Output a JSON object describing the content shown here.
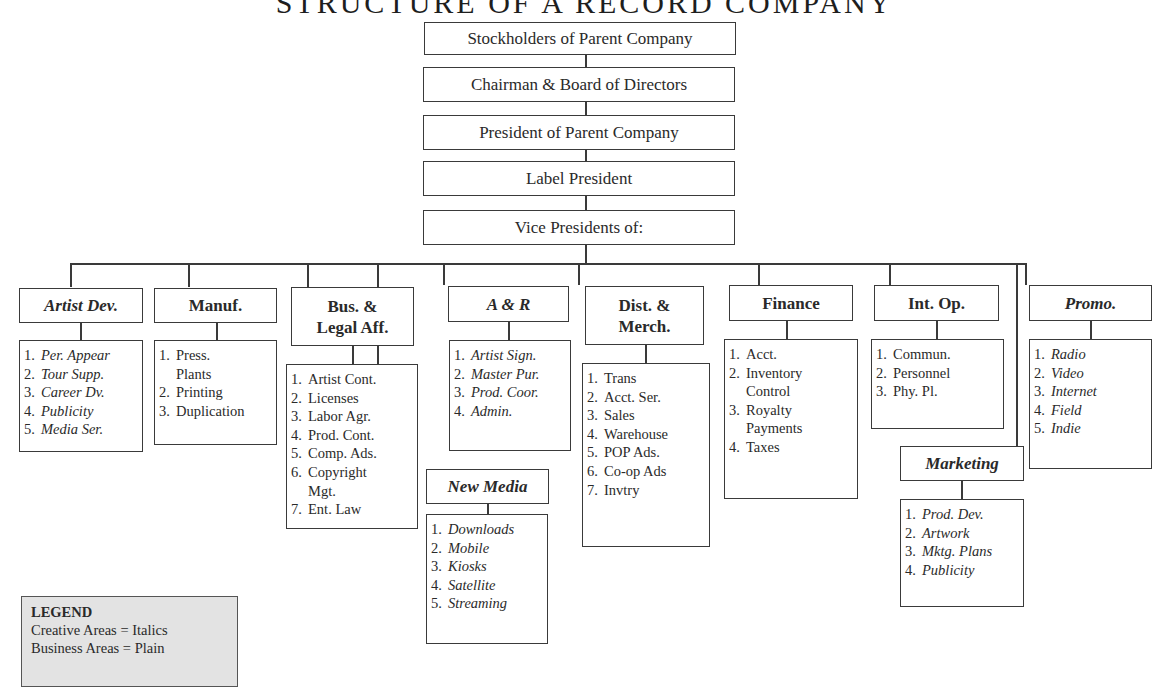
{
  "title": "STRUCTURE OF A RECORD COMPANY",
  "hierarchy": [
    "Stockholders of Parent Company",
    "Chairman & Board of Directors",
    "President of Parent Company",
    "Label President",
    "Vice Presidents of:"
  ],
  "departments": [
    {
      "name": "Artist Dev.",
      "style": "italic",
      "items": [
        "Per. Appear",
        "Tour Supp.",
        "Career Dv.",
        "Publicity",
        "Media Ser."
      ]
    },
    {
      "name": "Manuf.",
      "style": "plain",
      "items": [
        "Press.|Plants",
        "Printing",
        "Duplication"
      ]
    },
    {
      "name": "Bus. &|Legal Aff.",
      "style": "plain",
      "items": [
        "Artist Cont.",
        "Licenses",
        "Labor Agr.",
        "Prod. Cont.",
        "Comp. Ads.",
        "Copyright|Mgt.",
        "Ent. Law"
      ]
    },
    {
      "name": "New Media",
      "style": "italic",
      "items": [
        "Downloads",
        "Mobile",
        "Kiosks",
        "Satellite",
        "Streaming"
      ]
    },
    {
      "name": "A & R",
      "style": "italic",
      "items": [
        "Artist Sign.",
        "Master Pur.",
        "Prod. Coor.",
        "Admin."
      ]
    },
    {
      "name": "Dist. &|Merch.",
      "style": "plain",
      "items": [
        "Trans",
        "Acct. Ser.",
        "Sales",
        "Warehouse",
        "POP Ads.",
        "Co-op Ads",
        "Invtry"
      ]
    },
    {
      "name": "Finance",
      "style": "plain",
      "items": [
        "Acct.",
        "Inventory|Control",
        "Royalty|Payments",
        "Taxes"
      ]
    },
    {
      "name": "Int. Op.",
      "style": "plain",
      "items": [
        "Commun.",
        "Personnel",
        "Phy. Pl."
      ]
    },
    {
      "name": "Marketing",
      "style": "italic",
      "items": [
        "Prod. Dev.",
        "Artwork",
        "Mktg. Plans",
        "Publicity"
      ]
    },
    {
      "name": "Promo.",
      "style": "italic",
      "items": [
        "Radio",
        "Video",
        "Internet",
        "Field",
        "Indie"
      ]
    }
  ],
  "legend": {
    "title": "LEGEND",
    "lines": [
      "Creative Areas = Italics",
      "Business Areas = Plain"
    ]
  },
  "colors": {
    "line": "#3a3a3a",
    "legend_bg": "#e3e3e3"
  }
}
